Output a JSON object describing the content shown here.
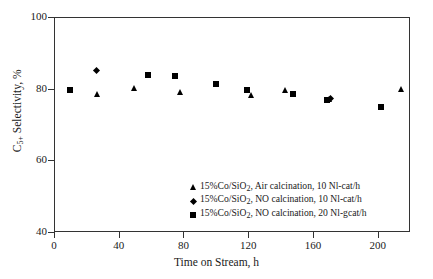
{
  "chart_data": {
    "type": "scatter",
    "title": "",
    "xlabel": "Time on Stream, h",
    "ylabel": "C5+ Selectivity, %",
    "ylabel_parts": {
      "base": "C",
      "sub": "5+",
      "rest": " Selectivity, %"
    },
    "xlim": [
      0,
      220
    ],
    "ylim": [
      40,
      100
    ],
    "xticks": [
      0,
      40,
      80,
      120,
      160,
      200
    ],
    "yticks": [
      40,
      60,
      80,
      100
    ],
    "xtick_labels": [
      "0",
      "40",
      "80",
      "120",
      "160",
      "200"
    ],
    "ytick_labels": [
      "40",
      "60",
      "80",
      "100"
    ],
    "grid": false,
    "legend_position": "lower-center-right",
    "series": [
      {
        "name": "15%Co/SiO2, Air calcination, 10 Nl-cat/h",
        "label_parts": {
          "pre": "15%Co/SiO",
          "sub": "2",
          "post": ", Air calcination, 10 Nl-cat/h"
        },
        "marker": "triangle",
        "color": "#000000",
        "points": [
          {
            "x": 27,
            "y": 78.5
          },
          {
            "x": 50,
            "y": 80.0
          },
          {
            "x": 78,
            "y": 79.0
          },
          {
            "x": 122,
            "y": 78.0
          },
          {
            "x": 143,
            "y": 79.5
          },
          {
            "x": 170,
            "y": 77.0
          },
          {
            "x": 215,
            "y": 79.7
          }
        ]
      },
      {
        "name": "15%Co/SiO2, NO calcination, 10 Nl-cat/h",
        "label_parts": {
          "pre": "15%Co/SiO",
          "sub": "2",
          "post": ", NO calcination, 10 Nl-cat/h"
        },
        "marker": "diamond",
        "color": "#000000",
        "points": [
          {
            "x": 26,
            "y": 85.0
          },
          {
            "x": 171,
            "y": 77.3
          }
        ]
      },
      {
        "name": "15%Co/SiO2, NO calcination, 20 Nl-gcat/h",
        "label_parts": {
          "pre": "15%Co/SiO",
          "sub": "2",
          "post": ", NO calcination, 20 Nl-gcat/h"
        },
        "marker": "square",
        "color": "#000000",
        "points": [
          {
            "x": 10,
            "y": 79.7
          },
          {
            "x": 58,
            "y": 83.7
          },
          {
            "x": 75,
            "y": 83.6
          },
          {
            "x": 100,
            "y": 81.3
          },
          {
            "x": 119,
            "y": 79.7
          },
          {
            "x": 148,
            "y": 78.5
          },
          {
            "x": 169,
            "y": 76.8
          },
          {
            "x": 202,
            "y": 74.8
          }
        ]
      }
    ]
  }
}
